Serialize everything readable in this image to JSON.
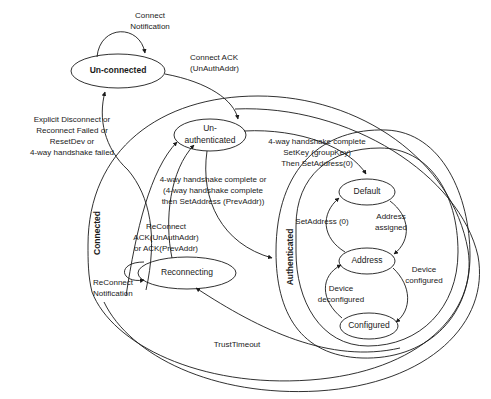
{
  "diagram": {
    "type": "state-machine",
    "width": 491,
    "height": 399,
    "stroke_color": "#1a1a1a",
    "background_color": "#ffffff"
  },
  "states": [
    {
      "id": "un-connected",
      "label": "Un-connected",
      "cx": 118,
      "cy": 71,
      "rx": 47,
      "ry": 17,
      "bold": true
    },
    {
      "id": "un-authenticated",
      "label_line1": "Un-",
      "label_line2": "authenticated",
      "cx": 210,
      "cy": 135,
      "rx": 36,
      "ry": 16
    },
    {
      "id": "reconnecting",
      "label": "Reconnecting",
      "cx": 187,
      "cy": 273,
      "rx": 49,
      "ry": 16
    },
    {
      "id": "default",
      "label": "Default",
      "cx": 367,
      "cy": 192,
      "rx": 28,
      "ry": 13
    },
    {
      "id": "address",
      "label": "Address",
      "cx": 367,
      "cy": 261,
      "rx": 28,
      "ry": 13
    },
    {
      "id": "configured",
      "label": "Configured",
      "cx": 369,
      "cy": 326,
      "rx": 29,
      "ry": 13
    }
  ],
  "regions": [
    {
      "id": "connected",
      "label": "Connected",
      "label_x": 100,
      "label_y": 233
    },
    {
      "id": "authenticated",
      "label": "Authenticated",
      "label_x": 293,
      "label_y": 257
    }
  ],
  "edge_labels": {
    "connect_notification": {
      "lines": [
        "Connect",
        "Notification"
      ],
      "x": 150,
      "y": 18
    },
    "connect_ack": {
      "lines": [
        "Connect ACK",
        "(UnAuthAddr)"
      ],
      "x": 190,
      "y": 60,
      "align": "left"
    },
    "explicit_disconnect": {
      "lines": [
        "Explicit Disconnect or",
        "Reconnect Failed or",
        "ResetDev or",
        "4-way handshake failed"
      ],
      "x": 72,
      "y": 122
    },
    "handshake_setkey": {
      "lines": [
        "4-way handshake complete",
        "SetKey (groupKey)",
        "Then SetAddress(0)"
      ],
      "x": 317,
      "y": 144
    },
    "handshake_prevaddr": {
      "lines": [
        "4-way handshake complete or",
        "(4-way handshake complete",
        "then SetAddress (PrevAddr))"
      ],
      "x": 213,
      "y": 182
    },
    "reconnect_ack": {
      "lines": [
        "ReConnect",
        "ACK(UnAuthAddr)",
        "or ACK(PrevAddr)"
      ],
      "x": 166,
      "y": 229
    },
    "reconnect_notification": {
      "lines": [
        "ReConnect",
        "Notification"
      ],
      "x": 123,
      "y": 285,
      "align": "left"
    },
    "setaddress_0": {
      "lines": [
        "SetAddress (0)"
      ],
      "x": 322,
      "y": 221
    },
    "address_assigned": {
      "lines": [
        "Address",
        "assigned"
      ],
      "x": 391,
      "y": 216
    },
    "device_configured": {
      "lines": [
        "Device",
        "configured"
      ],
      "x": 422,
      "y": 272
    },
    "device_deconfigured": {
      "lines": [
        "Device",
        "deconfigured"
      ],
      "x": 341,
      "y": 289
    },
    "trust_timeout": {
      "lines": [
        "TrustTimeout"
      ],
      "x": 237,
      "y": 347
    }
  }
}
